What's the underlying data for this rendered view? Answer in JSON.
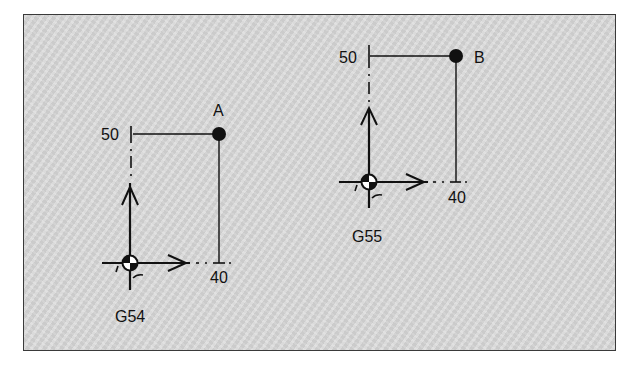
{
  "diagram": {
    "background_color": "#d6d6d6",
    "line_color": "#111111",
    "systems": [
      {
        "name": "G54",
        "origin_label": "G54",
        "point_label": "A",
        "x_value": "40",
        "y_value": "50"
      },
      {
        "name": "G55",
        "origin_label": "G55",
        "point_label": "B",
        "x_value": "40",
        "y_value": "50"
      }
    ]
  }
}
